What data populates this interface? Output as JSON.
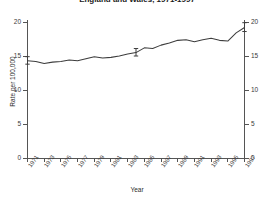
{
  "chart_data": {
    "type": "line",
    "title": "England and Wales, 1971-1997",
    "xlabel": "Year",
    "ylabel": "Rate per 100,000",
    "ylim": [
      0,
      20
    ],
    "yticks": [
      0,
      5,
      10,
      15,
      20
    ],
    "ytick_labels": [
      "0",
      "5",
      "10",
      "15",
      "20"
    ],
    "right_axis": true,
    "right_ytick_labels": [
      "0",
      "5",
      "10",
      "15",
      "20"
    ],
    "grid": false,
    "legend": "none",
    "xlim": [
      1971,
      1997
    ],
    "xtick_labels": [
      "1971",
      "1973",
      "1975",
      "1977",
      "1979",
      "1981",
      "1983",
      "1985",
      "1987",
      "1989",
      "1991",
      "1993",
      "1995",
      "1997"
    ],
    "x": [
      1971,
      1972,
      1973,
      1974,
      1975,
      1976,
      1977,
      1978,
      1979,
      1980,
      1981,
      1982,
      1983,
      1984,
      1985,
      1986,
      1987,
      1988,
      1989,
      1990,
      1991,
      1992,
      1993,
      1994,
      1995,
      1996,
      1997
    ],
    "values": [
      14.3,
      14.2,
      13.9,
      14.1,
      14.2,
      14.4,
      14.3,
      14.6,
      14.9,
      14.7,
      14.8,
      15.0,
      15.3,
      15.5,
      16.2,
      16.1,
      16.6,
      16.9,
      17.3,
      17.4,
      17.1,
      17.4,
      17.6,
      17.3,
      17.2,
      18.4,
      19.2
    ],
    "error_bars": [
      {
        "x": 1971,
        "y": 14.3,
        "lower": 13.8,
        "upper": 14.9
      },
      {
        "x": 1984,
        "y": 15.5,
        "lower": 15.0,
        "upper": 16.1
      },
      {
        "x": 1997,
        "y": 19.2,
        "lower": 18.6,
        "upper": 19.9
      }
    ],
    "line_color": "#3d3d3d",
    "axis_color": "#555555"
  },
  "axes": {
    "y_title": "Rate per 100,000",
    "x_title": "Year"
  }
}
